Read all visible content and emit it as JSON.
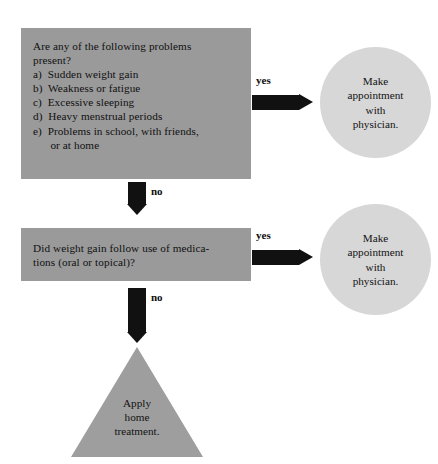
{
  "diagram": {
    "colors": {
      "box_fill": "#9a9a9a",
      "circle_fill": "#d7d7d7",
      "triangle_fill": "#9e9e9e",
      "arrow_fill": "#111111",
      "text": "#121212",
      "background": "#ffffff"
    },
    "nodes": {
      "question_1": {
        "type": "decision-box",
        "text": "Are any of the following problems\npresent?\na)  Sudden weight gain\nb)  Weakness or fatigue\nc)  Excessive sleeping\nd)  Heavy menstrual periods\ne)  Problems in school, with friends,\n      or at home"
      },
      "question_2": {
        "type": "decision-box",
        "text": "Did weight gain follow use of medica-\ntions (oral or topical)?"
      },
      "outcome_1": {
        "type": "terminator-circle",
        "text": "Make\nappointment\nwith\nphysician."
      },
      "outcome_2": {
        "type": "terminator-circle",
        "text": "Make\nappointment\nwith\nphysician."
      },
      "outcome_3": {
        "type": "triangle",
        "text": "Apply\nhome\ntreatment."
      }
    },
    "edges": {
      "q1_yes": {
        "label": "yes",
        "direction": "right"
      },
      "q1_no": {
        "label": "no",
        "direction": "down"
      },
      "q2_yes": {
        "label": "yes",
        "direction": "right"
      },
      "q2_no": {
        "label": "no",
        "direction": "down"
      }
    }
  }
}
